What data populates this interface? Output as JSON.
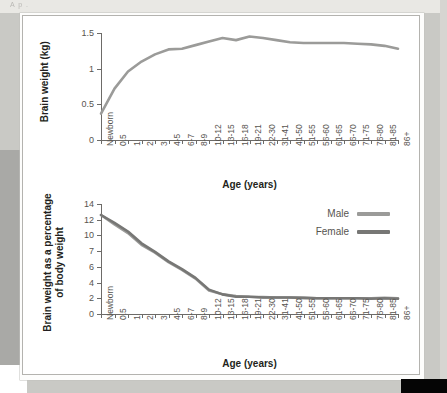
{
  "page": {
    "top_artifact_text": "A  p                                                                                                    ."
  },
  "charts": [
    {
      "id": "brain-weight-absolute",
      "ylabel": "Brain weight (kg)",
      "xlabel": "Age (years)",
      "yticks": [
        "0",
        "0.5",
        "1",
        "1.5"
      ],
      "ytick_values": [
        0,
        0.5,
        1,
        1.5
      ],
      "ylim": [
        0,
        1.5
      ],
      "categories": [
        "Newborn",
        "0.5",
        "1",
        "2",
        "3",
        "4-5",
        "6-7",
        "8-9",
        "10-12",
        "13-15",
        "16-18",
        "19-21",
        "22-30",
        "31-41",
        "41-50",
        "51-55",
        "56-60",
        "61-65",
        "66-70",
        "71-75",
        "76-80",
        "81-85",
        "86+"
      ],
      "series": [
        {
          "name": "Male",
          "color": "#9b9b99",
          "values": [
            0.37,
            0.72,
            0.96,
            1.1,
            1.2,
            1.27,
            1.28,
            1.33,
            1.38,
            1.43,
            1.4,
            1.45,
            1.43,
            1.4,
            1.37,
            1.36,
            1.36,
            1.36,
            1.36,
            1.35,
            1.34,
            1.32,
            1.28
          ]
        },
        {
          "name": "Female",
          "color": "#77777 5",
          "values": [
            0.36,
            0.7,
            0.94,
            1.03,
            1.09,
            1.15,
            1.19,
            1.17,
            1.23,
            1.26,
            1.31,
            1.27,
            1.27,
            1.27,
            1.26,
            1.25,
            1.24,
            1.22,
            1.21,
            1.2,
            1.18,
            1.16,
            1.12
          ]
        }
      ]
    },
    {
      "id": "brain-weight-percentage",
      "ylabel": "Brain weight as a percentage\nof body weight",
      "ylabel_line1": "Brain weight as a percentage",
      "ylabel_line2": "of body weight",
      "xlabel": "Age (years)",
      "yticks": [
        "0",
        "2",
        "4",
        "6",
        "7",
        "10",
        "12",
        "14"
      ],
      "ytick_values": [
        0,
        2,
        4,
        6,
        8,
        10,
        12,
        14
      ],
      "ylim": [
        0,
        14
      ],
      "categories": [
        "Newborn",
        "0.5",
        "1",
        "2",
        "3",
        "4-5",
        "6-7",
        "8-9",
        "10-12",
        "13-15",
        "16-18",
        "19-21",
        "22-30",
        "31-41",
        "41-50",
        "51-55",
        "56-60",
        "61-65",
        "66-70",
        "71-75",
        "76-80",
        "81-85",
        "86+"
      ],
      "series": [
        {
          "name": "Male",
          "color": "#9b9b99",
          "values": [
            12.6,
            11.4,
            10.3,
            8.8,
            7.8,
            6.6,
            5.6,
            4.5,
            3.0,
            2.5,
            2.3,
            2.2,
            2.15,
            2.1,
            2.1,
            2.05,
            2.0,
            2.0,
            2.0,
            2.0,
            2.0,
            2.05,
            2.0
          ]
        },
        {
          "name": "Female",
          "color": "#777775",
          "values": [
            12.6,
            11.6,
            10.5,
            9.0,
            7.9,
            6.7,
            5.7,
            4.6,
            3.1,
            2.5,
            2.2,
            2.2,
            2.1,
            2.1,
            2.1,
            2.05,
            2.0,
            2.0,
            2.0,
            2.0,
            1.95,
            2.0,
            1.95
          ]
        }
      ],
      "legend": {
        "position": "top-right",
        "entries": [
          {
            "label": "Male",
            "color": "#9b9b99"
          },
          {
            "label": "Female",
            "color": "#777775"
          }
        ]
      }
    }
  ]
}
